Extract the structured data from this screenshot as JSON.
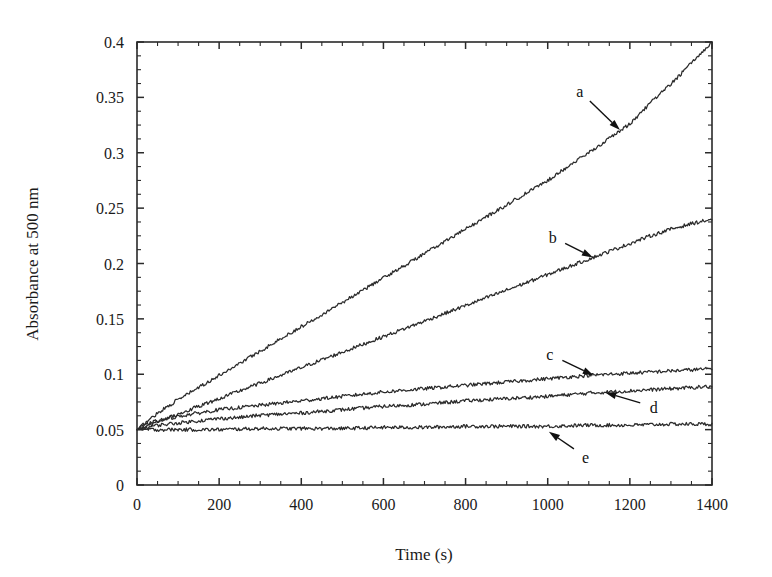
{
  "chart_data": {
    "type": "line",
    "title": "",
    "xlabel": "Time (s)",
    "ylabel": "Absorbance at 500 nm",
    "xlim": [
      0,
      1400
    ],
    "ylim": [
      0,
      0.4
    ],
    "xticks": [
      0,
      200,
      400,
      600,
      800,
      1000,
      1200,
      1400
    ],
    "xtick_labels": [
      "0",
      "200",
      "400",
      "600",
      "800",
      "1000",
      "1200",
      "1400"
    ],
    "x_minor_interval": 50,
    "yticks": [
      0,
      0.05,
      0.1,
      0.15,
      0.2,
      0.25,
      0.3,
      0.35,
      0.4
    ],
    "ytick_labels": [
      "0",
      "0.05",
      "0.1",
      "0.15",
      "0.2",
      "0.25",
      "0.3",
      "0.35",
      "0.4"
    ],
    "y_minor_interval": 0.0125,
    "grid": false,
    "legend": "inline-annotations",
    "noise_amplitude": 0.0016,
    "line_color": "#2b2b2b",
    "series": [
      {
        "name": "a",
        "x": [
          0,
          50,
          100,
          150,
          200,
          250,
          300,
          350,
          400,
          450,
          500,
          550,
          600,
          650,
          700,
          750,
          800,
          850,
          900,
          950,
          1000,
          1050,
          1100,
          1150,
          1200,
          1250,
          1300,
          1350,
          1400
        ],
        "values": [
          0.05,
          0.065,
          0.077,
          0.088,
          0.099,
          0.11,
          0.121,
          0.132,
          0.143,
          0.154,
          0.165,
          0.176,
          0.187,
          0.198,
          0.209,
          0.22,
          0.231,
          0.242,
          0.253,
          0.264,
          0.275,
          0.288,
          0.3,
          0.313,
          0.326,
          0.345,
          0.362,
          0.381,
          0.4
        ]
      },
      {
        "name": "b",
        "x": [
          0,
          50,
          100,
          150,
          200,
          250,
          300,
          350,
          400,
          450,
          500,
          550,
          600,
          650,
          700,
          750,
          800,
          850,
          900,
          950,
          1000,
          1050,
          1100,
          1150,
          1200,
          1250,
          1300,
          1350,
          1400
        ],
        "values": [
          0.05,
          0.057,
          0.064,
          0.071,
          0.078,
          0.085,
          0.092,
          0.099,
          0.106,
          0.113,
          0.12,
          0.127,
          0.134,
          0.141,
          0.148,
          0.155,
          0.162,
          0.169,
          0.176,
          0.183,
          0.19,
          0.197,
          0.204,
          0.211,
          0.218,
          0.225,
          0.231,
          0.236,
          0.24
        ]
      },
      {
        "name": "c",
        "x": [
          0,
          25,
          50,
          75,
          100,
          150,
          200,
          250,
          300,
          350,
          400,
          500,
          600,
          700,
          800,
          900,
          1000,
          1100,
          1200,
          1300,
          1400
        ],
        "values": [
          0.05,
          0.055,
          0.058,
          0.06,
          0.062,
          0.065,
          0.068,
          0.07,
          0.072,
          0.074,
          0.076,
          0.08,
          0.084,
          0.087,
          0.09,
          0.093,
          0.096,
          0.099,
          0.101,
          0.103,
          0.105
        ]
      },
      {
        "name": "d",
        "x": [
          0,
          25,
          50,
          75,
          100,
          150,
          200,
          250,
          300,
          350,
          400,
          500,
          600,
          700,
          800,
          900,
          1000,
          1100,
          1200,
          1300,
          1400
        ],
        "values": [
          0.05,
          0.052,
          0.054,
          0.055,
          0.056,
          0.058,
          0.06,
          0.061,
          0.063,
          0.064,
          0.065,
          0.068,
          0.071,
          0.073,
          0.076,
          0.078,
          0.08,
          0.083,
          0.085,
          0.087,
          0.089
        ]
      },
      {
        "name": "e",
        "x": [
          0,
          25,
          50,
          100,
          150,
          200,
          300,
          400,
          500,
          600,
          700,
          800,
          900,
          1000,
          1100,
          1200,
          1300,
          1400
        ],
        "values": [
          0.05,
          0.05,
          0.05,
          0.05,
          0.05,
          0.05,
          0.051,
          0.051,
          0.051,
          0.052,
          0.052,
          0.053,
          0.053,
          0.053,
          0.054,
          0.054,
          0.055,
          0.055
        ]
      }
    ],
    "annotations": [
      {
        "label": "a",
        "label_x": 1078,
        "label_y": 0.3555,
        "tip_x": 1176,
        "tip_y": 0.3205
      },
      {
        "label": "b",
        "label_x": 1012,
        "label_y": 0.224,
        "tip_x": 1110,
        "tip_y": 0.2055
      },
      {
        "label": "c",
        "label_x": 1005,
        "label_y": 0.118,
        "tip_x": 1112,
        "tip_y": 0.099
      },
      {
        "label": "d",
        "label_x": 1258,
        "label_y": 0.0705,
        "tip_x": 1140,
        "tip_y": 0.0835
      },
      {
        "label": "e",
        "label_x": 1092,
        "label_y": 0.0255,
        "tip_x": 1003,
        "tip_y": 0.048
      }
    ]
  }
}
